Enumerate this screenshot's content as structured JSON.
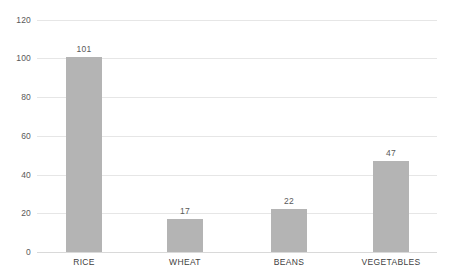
{
  "chart_data": {
    "type": "bar",
    "title": "",
    "subtitle": "",
    "xlabel": "",
    "ylabel": "",
    "categories": [
      "RICE",
      "WHEAT",
      "BEANS",
      "VEGETABLES"
    ],
    "values": [
      101,
      17,
      22,
      47
    ],
    "data_labels": [
      "101",
      "17",
      "22",
      "47"
    ],
    "ylim": [
      0,
      120
    ],
    "ytick_values": [
      0,
      20,
      40,
      60,
      80,
      100,
      120
    ],
    "ytick_labels": [
      "0",
      "20",
      "40",
      "60",
      "80",
      "100",
      "120"
    ],
    "grid": true,
    "grid_axis": "y",
    "legend": false,
    "legend_position": "none",
    "colors": {
      "bar_fill": "#b4b4b4",
      "gridline": "#e6e6e6",
      "baseline": "#d9d9d9",
      "tick_label": "#595959",
      "category_label": "#404040",
      "data_label": "#595959",
      "background": "#ffffff"
    }
  }
}
